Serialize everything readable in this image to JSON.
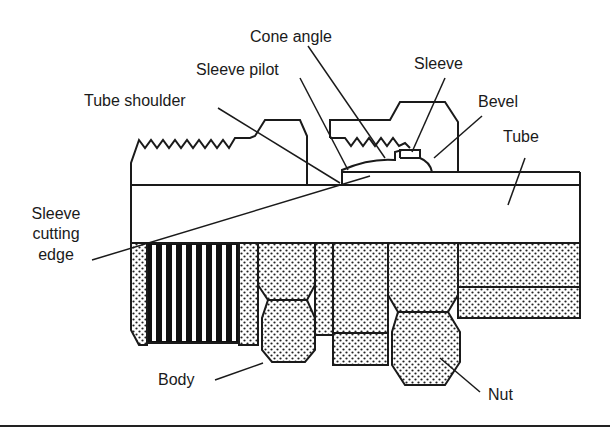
{
  "figure": {
    "labels": {
      "cone_angle": "Cone angle",
      "sleeve_pilot": "Sleeve pilot",
      "sleeve": "Sleeve",
      "tube_shoulder": "Tube shoulder",
      "bevel": "Bevel",
      "tube": "Tube",
      "sleeve_cutting_edge_line1": "Sleeve",
      "sleeve_cutting_edge_line2": "cutting",
      "sleeve_cutting_edge_line3": "edge",
      "body": "Body",
      "nut": "Nut"
    },
    "colors": {
      "line": "#1a1a1a",
      "background": "#ffffff",
      "stipple": "#222222"
    }
  }
}
